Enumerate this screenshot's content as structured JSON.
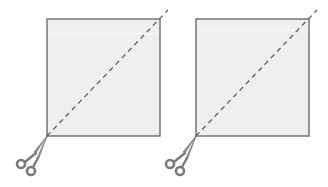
{
  "diagram": {
    "colors": {
      "background": "#ffffff",
      "square_fill": "#efefef",
      "square_border": "#6b6b6b",
      "dash_line": "#555555",
      "scissors": "#7a7a7a"
    },
    "panels": [
      {
        "id": "left",
        "square": {
          "x": 47,
          "y": 19,
          "w": 113,
          "h": 117
        },
        "cut_line": {
          "x1": 47,
          "y1": 136,
          "x2": 168,
          "y2": 10
        },
        "scissors_icon": "scissors-icon"
      },
      {
        "id": "right",
        "square": {
          "x": 196,
          "y": 19,
          "w": 113,
          "h": 117
        },
        "cut_line": {
          "x1": 196,
          "y1": 136,
          "x2": 317,
          "y2": 10
        },
        "scissors_icon": "scissors-icon"
      }
    ]
  }
}
